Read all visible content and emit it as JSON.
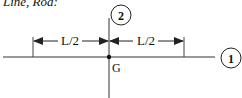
{
  "diagram": {
    "title": "Line, Rod:",
    "axis_labels": {
      "axis1": "1",
      "axis2": "2"
    },
    "dimension_left": "L/2",
    "dimension_right": "L/2",
    "centroid_label": "G",
    "colors": {
      "line": "#222222",
      "background": "#ffffff"
    }
  }
}
